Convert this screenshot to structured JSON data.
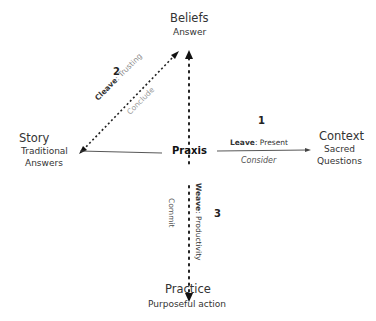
{
  "nodes": {
    "top": {
      "title": "Beliefs",
      "subtitle": "Answer"
    },
    "left": {
      "title": "Story",
      "subtitle_line1": "Traditional",
      "subtitle_line2": "Answers"
    },
    "right": {
      "title": "Context",
      "subtitle_line1": "Sacred",
      "subtitle_line2": "Questions"
    },
    "bottom": {
      "title": "Practice",
      "subtitle": "Purposeful action"
    },
    "center": {
      "title": "Praxis"
    }
  },
  "edges": {
    "cleave": {
      "number": "2",
      "verb": "Cleave",
      "quality": ": Trusting",
      "action": "Conclude"
    },
    "leave": {
      "number": "1",
      "verb": "Leave",
      "quality": ": Present",
      "action": "Consider"
    },
    "weave": {
      "number": "3",
      "verb": "Weave",
      "quality": ": Productivity",
      "action": "Commit"
    }
  }
}
